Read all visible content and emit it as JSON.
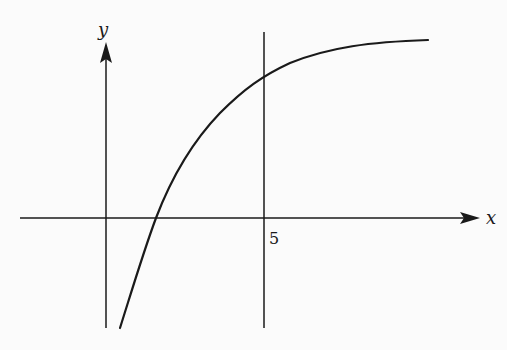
{
  "diagram": {
    "type": "function-graph",
    "axes": {
      "x_label": "x",
      "y_label": "y"
    },
    "vertical_line": {
      "x_value_label": "5"
    },
    "curve": {
      "description": "Increasing concave-down curve approaching a horizontal asymptote, crossing the x-axis between x=0 and x=5",
      "points_px": [
        [
          120,
          328
        ],
        [
          138,
          272
        ],
        [
          156,
          218
        ],
        [
          176,
          178
        ],
        [
          200,
          140
        ],
        [
          230,
          104
        ],
        [
          264,
          73
        ],
        [
          300,
          58
        ],
        [
          340,
          48
        ],
        [
          385,
          42
        ],
        [
          428,
          40
        ]
      ]
    },
    "colors": {
      "ink": "#1a1a1a",
      "background": "#fbfbfb"
    }
  }
}
